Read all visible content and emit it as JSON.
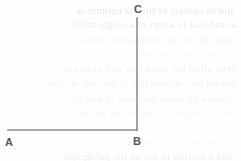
{
  "figure": {
    "kind": "geometry-diagram",
    "width": 241,
    "height": 161,
    "background_color": "#fefefe",
    "stroke_color": "#8a8d93",
    "stroke_width": 1.6,
    "label_color": "#55575c",
    "vertices": [
      {
        "id": "A",
        "label": "A",
        "x": 8,
        "y": 130
      },
      {
        "id": "B",
        "label": "B",
        "x": 137,
        "y": 130
      },
      {
        "id": "C",
        "label": "C",
        "x": 137,
        "y": 18
      }
    ],
    "segments": [
      {
        "id": "AB",
        "from": "A",
        "to": "B"
      },
      {
        "id": "BC",
        "from": "B",
        "to": "C"
      }
    ]
  },
  "bleed_text": {
    "note": "Faint mirrored show-through text from the reverse side of the page",
    "lines": [
      {
        "text": "and in contact of the 1st column is",
        "x": 6,
        "y": 4,
        "size": 11,
        "class": "bleed-line"
      },
      {
        "text": "a read that is a part of a single table",
        "x": 4,
        "y": 18,
        "size": 11,
        "class": "bleed-line warm"
      },
      {
        "text": "that, for in the section row that is",
        "x": 10,
        "y": 33,
        "size": 11,
        "class": "bleed-line soft"
      },
      {
        "text": "it as it the same level",
        "x": 14,
        "y": 48,
        "size": 11,
        "class": "bleed-line softer"
      },
      {
        "text": "type all in the same row and after one",
        "x": 6,
        "y": 62,
        "size": 11,
        "class": "bleed-line soft"
      },
      {
        "text": "one on two objects this is the row of case",
        "x": 4,
        "y": 77,
        "size": 11,
        "class": "bleed-line soft"
      },
      {
        "text": "from a by some columns of and in",
        "x": 10,
        "y": 92,
        "size": 11,
        "class": "bleed-line soft"
      },
      {
        "text": "and a section at number on the and",
        "x": 8,
        "y": 107,
        "size": 11,
        "class": "bleed-line softer"
      },
      {
        "text": "as the one for the one in",
        "x": 6,
        "y": 136,
        "size": 11,
        "class": "bleed-line softer"
      },
      {
        "text": "and a section in the on the paragraph",
        "x": 8,
        "y": 150,
        "size": 11,
        "class": "bleed-line warm"
      }
    ]
  }
}
